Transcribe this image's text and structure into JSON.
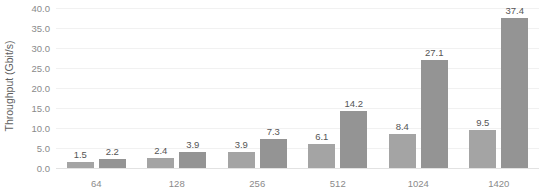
{
  "chart_data": {
    "type": "bar",
    "title": "",
    "subtitle": "",
    "xlabel": "",
    "ylabel": "Throughput (Gbit/s)",
    "categories": [
      "64",
      "128",
      "256",
      "512",
      "1024",
      "1420"
    ],
    "series": [
      {
        "name": "series-1",
        "color": "#a4a4a4",
        "values": [
          1.5,
          2.4,
          3.9,
          6.1,
          8.4,
          9.5
        ],
        "labels": [
          "1.5",
          "2.4",
          "3.9",
          "6.1",
          "8.4",
          "9.5"
        ]
      },
      {
        "name": "series-2",
        "color": "#949494",
        "values": [
          2.2,
          3.9,
          7.3,
          14.2,
          27.1,
          37.4
        ],
        "labels": [
          "2.2",
          "3.9",
          "7.3",
          "14.2",
          "27.1",
          "37.4"
        ]
      }
    ],
    "ylim": [
      0.0,
      40.0
    ],
    "ystep": 5.0,
    "ytick_labels": [
      "40.0",
      "35.0",
      "30.0",
      "25.0",
      "20.0",
      "15.0",
      "10.0",
      "5.0",
      "0.0"
    ],
    "ytick_values": [
      40.0,
      35.0,
      30.0,
      25.0,
      20.0,
      15.0,
      10.0,
      5.0,
      0.0
    ],
    "grid": true,
    "grid_color": "#f1f1f1",
    "axis_color": "#e2e2e2",
    "legend": false,
    "legend_position": "none",
    "background": "#ffffff",
    "data_labels": true
  }
}
